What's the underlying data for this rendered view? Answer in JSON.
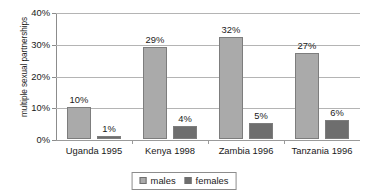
{
  "chart_data": {
    "type": "bar",
    "title": "",
    "xlabel": "",
    "ylabel": "multiple sexual partnerships",
    "categories": [
      "Uganda 1995",
      "Kenya 1998",
      "Zambia 1996",
      "Tanzania 1996"
    ],
    "series": [
      {
        "name": "males",
        "color": "#aaaaaa",
        "values": [
          10,
          29,
          32,
          27
        ],
        "labels": [
          "10%",
          "29%",
          "32%",
          "27%"
        ]
      },
      {
        "name": "females",
        "color": "#6e6e6e",
        "values": [
          1,
          4,
          5,
          6
        ],
        "labels": [
          "1%",
          "4%",
          "5%",
          "6%"
        ]
      }
    ],
    "ylim": [
      0,
      40
    ],
    "yticks": [
      0,
      10,
      20,
      30,
      40
    ],
    "ytick_labels": [
      "0%",
      "10%",
      "20%",
      "30%",
      "40%"
    ],
    "grid": true,
    "legend_position": "bottom"
  },
  "legend": {
    "items": [
      {
        "label": "males"
      },
      {
        "label": "females"
      }
    ]
  },
  "colors": {
    "males": "#aaaaaa",
    "females": "#6e6e6e",
    "gridline": "#b4b4b4",
    "axis": "#8c8c8c",
    "text": "#1a1a1a",
    "background": "#ffffff"
  }
}
